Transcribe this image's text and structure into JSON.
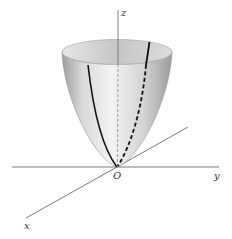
{
  "figure": {
    "type": "3D surface diagram",
    "surface": "elliptic paraboloid opening upward",
    "vertex_label": "O",
    "axes": {
      "x_label": "x",
      "y_label": "y",
      "z_label": "z"
    },
    "colors": {
      "axis": "#555555",
      "curve": "#111111",
      "surface_light": "#f2f2f2",
      "surface_dark": "#a8a8a8",
      "rim_inside": "#cfcfcf"
    }
  }
}
